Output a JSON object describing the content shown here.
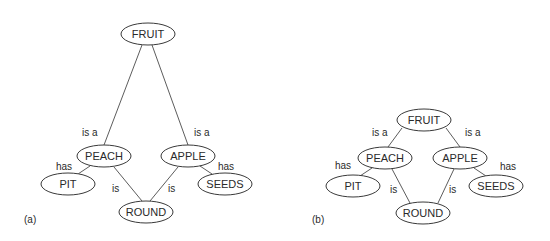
{
  "diagrams": [
    {
      "label": "(a)",
      "nodes": {
        "fruit": "FRUIT",
        "peach": "PEACH",
        "apple": "APPLE",
        "pit": "PIT",
        "seeds": "SEEDS",
        "round": "ROUND"
      },
      "edges": {
        "peach_fruit": "is a",
        "apple_fruit": "is a",
        "peach_pit": "has",
        "apple_seeds": "has",
        "peach_round": "is",
        "apple_round": "is"
      }
    },
    {
      "label": "(b)",
      "nodes": {
        "fruit": "FRUIT",
        "peach": "PEACH",
        "apple": "APPLE",
        "pit": "PIT",
        "seeds": "SEEDS",
        "round": "ROUND"
      },
      "edges": {
        "peach_fruit": "is a",
        "apple_fruit": "is a",
        "peach_pit": "has",
        "apple_seeds": "has",
        "peach_round": "is",
        "apple_round": "is"
      }
    }
  ]
}
